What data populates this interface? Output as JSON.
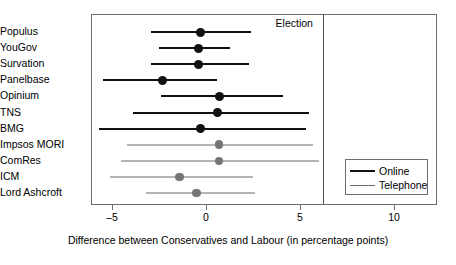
{
  "chart_data": {
    "type": "scatter",
    "title": "",
    "xlabel": "Difference between Conservatives and Labour (in percentage points)",
    "ylabel": "",
    "xlim": [
      -7.6,
      11.4
    ],
    "xticks": [
      -5,
      0,
      5,
      10
    ],
    "xtick_labels": [
      "–5",
      "0",
      "5",
      "10"
    ],
    "grid": false,
    "legend_position": "bottom-right",
    "annotations": [
      {
        "label": "Election",
        "type": "vline",
        "x": 6.2
      }
    ],
    "series": [
      {
        "name": "Online",
        "color": "#111111"
      },
      {
        "name": "Telephone",
        "color": "#757575"
      }
    ],
    "categories": [
      "Populus",
      "YouGov",
      "Survation",
      "Panelbase",
      "Opinium",
      "TNS",
      "BMG",
      "Impsos MORI",
      "ComRes",
      "ICM",
      "Lord Ashcroft"
    ],
    "points": [
      {
        "label": "Populus",
        "mode": "Online",
        "estimate": -0.3,
        "low": -2.9,
        "high": 2.4
      },
      {
        "label": "YouGov",
        "mode": "Online",
        "estimate": -0.4,
        "low": -2.5,
        "high": 1.3
      },
      {
        "label": "Survation",
        "mode": "Online",
        "estimate": -0.4,
        "low": -2.9,
        "high": 2.3
      },
      {
        "label": "Panelbase",
        "mode": "Online",
        "estimate": -2.3,
        "low": -5.5,
        "high": 0.6
      },
      {
        "label": "Opinium",
        "mode": "Online",
        "estimate": 0.7,
        "low": -2.4,
        "high": 4.1
      },
      {
        "label": "TNS",
        "mode": "Online",
        "estimate": 0.6,
        "low": -3.9,
        "high": 5.5
      },
      {
        "label": "BMG",
        "mode": "Online",
        "estimate": -0.3,
        "low": -5.7,
        "high": 5.3
      },
      {
        "label": "Impsos MORI",
        "mode": "Telephone",
        "estimate": 0.7,
        "low": -4.2,
        "high": 5.7
      },
      {
        "label": "ComRes",
        "mode": "Telephone",
        "estimate": 0.7,
        "low": -4.5,
        "high": 6.0
      },
      {
        "label": "ICM",
        "mode": "Telephone",
        "estimate": -1.4,
        "low": -5.1,
        "high": 2.5
      },
      {
        "label": "Lord Ashcroft",
        "mode": "Telephone",
        "estimate": -0.5,
        "low": -3.2,
        "high": 2.6
      }
    ]
  },
  "legend": {
    "items": [
      {
        "label": "Online",
        "key": "online"
      },
      {
        "label": "Telephone",
        "key": "telephone"
      }
    ]
  }
}
